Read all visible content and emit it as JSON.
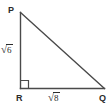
{
  "figure": {
    "kind": "right-triangle-diagram",
    "background_color": "#ffffff",
    "stroke_color": "#4a4a4a",
    "text_color": "#2b2b2b",
    "vertices": {
      "p": {
        "label": "P",
        "x": 20,
        "y": 12
      },
      "r": {
        "label": "R",
        "x": 20,
        "y": 88
      },
      "q": {
        "label": "Q",
        "x": 104,
        "y": 88
      }
    },
    "right_angle": {
      "at": "R",
      "marker": "square",
      "size": 8
    },
    "sides": {
      "vertical_leg": {
        "name": "PR",
        "radical_sign": "√",
        "radicand": "6",
        "text": "√6"
      },
      "base_leg": {
        "name": "RQ",
        "radical_sign": "√",
        "radicand": "8",
        "text": "√8"
      },
      "hypotenuse": {
        "name": "PQ",
        "text": ""
      }
    }
  }
}
